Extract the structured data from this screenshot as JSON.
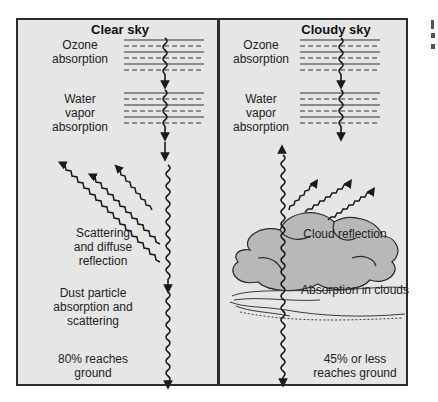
{
  "panels": {
    "clear": {
      "title": "Clear sky",
      "ozone": "Ozone absorption",
      "ozone_l1": "Ozone",
      "ozone_l2": "absorption",
      "water_l1": "Water",
      "water_l2": "vapor",
      "water_l3": "absorption",
      "scatter_l1": "Scattering",
      "scatter_l2": "and diffuse",
      "scatter_l3": "reflection",
      "dust_l1": "Dust particle",
      "dust_l2": "absorption and",
      "dust_l3": "scattering",
      "ground_l1": "80% reaches",
      "ground_l2": "ground"
    },
    "cloudy": {
      "title": "Cloudy sky",
      "ozone_l1": "Ozone",
      "ozone_l2": "absorption",
      "water_l1": "Water",
      "water_l2": "vapor",
      "water_l3": "absorption",
      "reflection": "Cloud reflection",
      "absorption": "Absorption in clouds",
      "ground_l1": "45% or less",
      "ground_l2": "reaches ground"
    }
  },
  "colors": {
    "panel_bg": "#e6e6e6",
    "cloud_fill": "#b8b8b8",
    "line": "#1a1a1a"
  }
}
